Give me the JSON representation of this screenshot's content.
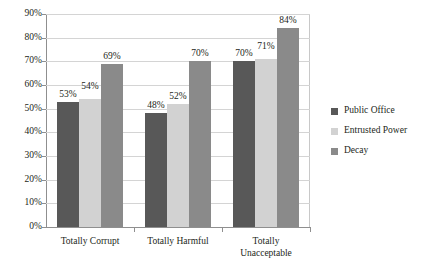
{
  "chart_data": {
    "type": "bar",
    "title": "",
    "xlabel": "",
    "ylabel": "",
    "ylim": [
      0,
      90
    ],
    "grid": true,
    "legend_position": "right",
    "categories": [
      "Totally Corrupt",
      "Totally Harmful",
      "Totally Unacceptable"
    ],
    "category_lines": [
      [
        "Totally Corrupt"
      ],
      [
        "Totally Harmful"
      ],
      [
        "Totally",
        "Unacceptable"
      ]
    ],
    "ytick_labels": [
      "90%",
      "80%",
      "70%",
      "60%",
      "50%",
      "40%",
      "30%",
      "20%",
      "10%",
      "0%"
    ],
    "ytick_values": [
      90,
      80,
      70,
      60,
      50,
      40,
      30,
      20,
      10,
      0
    ],
    "series": [
      {
        "name": "Public Office",
        "color": "#585858",
        "values": [
          53,
          48,
          70
        ],
        "labels": [
          "53%",
          "48%",
          "70%"
        ]
      },
      {
        "name": "Entrusted Power",
        "color": "#d2d2d2",
        "values": [
          54,
          52,
          71
        ],
        "labels": [
          "54%",
          "52%",
          "71%"
        ]
      },
      {
        "name": "Decay",
        "color": "#8a8a8a",
        "values": [
          69,
          70,
          84
        ],
        "labels": [
          "69%",
          "70%",
          "84%"
        ]
      }
    ]
  },
  "legend": {
    "items": [
      {
        "label": "Public Office"
      },
      {
        "label": "Entrusted Power"
      },
      {
        "label": "Decay"
      }
    ]
  }
}
